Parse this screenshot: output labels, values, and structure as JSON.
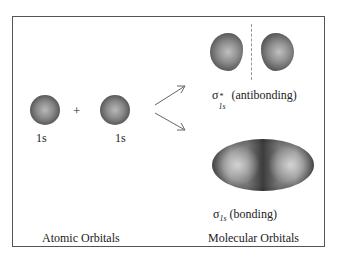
{
  "diagram": {
    "atomic": {
      "left_label": "1s",
      "right_label": "1s",
      "plus": "+",
      "caption": "Atomic Orbitals"
    },
    "molecular": {
      "antibonding": {
        "symbol": "σ",
        "subscript": "1s",
        "superscript": "*",
        "label": "(antibonding)"
      },
      "bonding": {
        "symbol": "σ",
        "subscript": "1s",
        "label": "(bonding)"
      },
      "caption": "Molecular Orbitals"
    },
    "colors": {
      "frame": "#555555",
      "orbital_dark": "#333333",
      "orbital_light": "#b8b8b8"
    }
  }
}
